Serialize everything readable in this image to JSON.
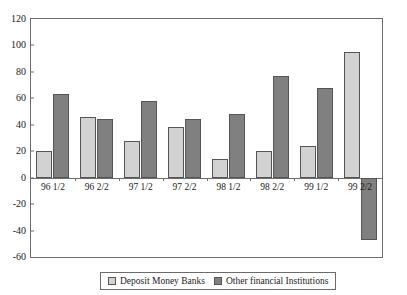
{
  "chart_data": {
    "type": "bar",
    "title": "",
    "subtitle": "",
    "xlabel": "",
    "ylabel": "",
    "categories": [
      "96 1/2",
      "96 2/2",
      "97 1/2",
      "97 2/2",
      "98 1/2",
      "98 2/2",
      "99 1/2",
      "99 2/2"
    ],
    "series": [
      {
        "name": "Deposit Money Banks",
        "color": "#d2d2d2",
        "values": [
          20,
          46,
          28,
          38,
          14,
          20,
          24,
          95
        ]
      },
      {
        "name": "Other financial Institutions",
        "color": "#808080",
        "values": [
          63,
          44,
          58,
          44,
          48,
          77,
          68,
          -47
        ]
      }
    ],
    "ylim": [
      -60,
      120
    ],
    "ytick_values": [
      120,
      100,
      80,
      60,
      40,
      20,
      0,
      -20,
      -40,
      -60
    ],
    "ytick_labels": [
      "120",
      "100",
      "80",
      "60",
      "40",
      "20",
      "0",
      "-20",
      "-40",
      "-60"
    ],
    "grid": false,
    "legend_position": "bottom",
    "plot_background": "#ffffff",
    "axis_color": "#6b6b6b",
    "bar_border_color": "#555555"
  }
}
